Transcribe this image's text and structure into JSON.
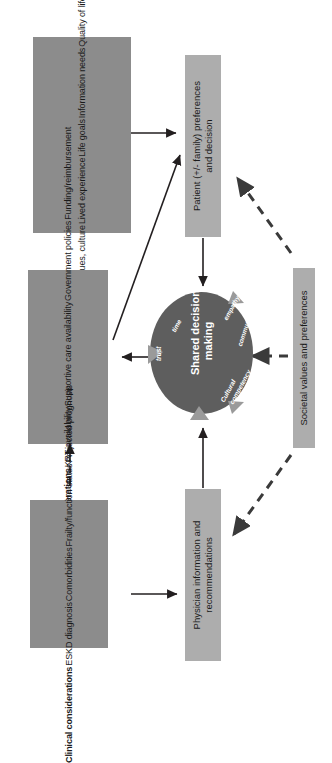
{
  "figure": {
    "orientation": "rotated-90-ccw",
    "background_color": "#ffffff",
    "colors": {
      "consideration_box": "#8c8c8c",
      "stage_box": "#adadad",
      "circle": "#5e5e5e",
      "circle_text": "#ffffff",
      "arrow_solid": "#231f20",
      "arrow_dashed": "#3a3a3a",
      "circle_arrowhead": "#8c8c8c"
    }
  },
  "boxes": {
    "patient_considerations": {
      "title": "Patient considerations",
      "items": [
        "Values, culture",
        "Lived experience",
        "Life goals",
        "Information needs",
        "Quality of life",
        "Family resources  & values"
      ]
    },
    "system_considerations": {
      "title": "System-level considerations",
      "items": [
        "KRT availability",
        "Supportive care availability",
        "Government policies",
        "Funding/reimbursement"
      ]
    },
    "clinical_considerations": {
      "title": "Clinical considerations",
      "items": [
        "ESKD diagnosis",
        "Comorbidities",
        "Frailty/function status",
        "Projected prognosis"
      ]
    },
    "patient_decision": {
      "line1": "Patient (+/- family) preferences",
      "line2": "and decision"
    },
    "physician_recommendations": {
      "line1": "Physician information and",
      "line2": "recommendations"
    },
    "societal_values": {
      "label": "Societal values and preferences"
    }
  },
  "circle": {
    "core_line1": "Shared decision",
    "core_line2": "making",
    "attributes": [
      "trust",
      "time",
      "empathy",
      "communication",
      "Cultural",
      "competency"
    ]
  },
  "connections": [
    {
      "name": "patient-considerations-to-patient-decision",
      "style": "solid"
    },
    {
      "name": "system-considerations-to-patient-decision",
      "style": "solid"
    },
    {
      "name": "clinical-considerations-to-system-considerations",
      "style": "dashed"
    },
    {
      "name": "clinical-considerations-to-physician-recommendations",
      "style": "solid"
    },
    {
      "name": "system-considerations-to-shared-decision",
      "style": "solid"
    },
    {
      "name": "patient-decision-to-shared-decision",
      "style": "solid"
    },
    {
      "name": "physician-recommendations-to-shared-decision",
      "style": "solid"
    },
    {
      "name": "societal-values-to-patient-decision",
      "style": "dashed"
    },
    {
      "name": "societal-values-to-shared-decision",
      "style": "dashed"
    },
    {
      "name": "societal-values-to-physician-recommendations",
      "style": "dashed"
    }
  ]
}
